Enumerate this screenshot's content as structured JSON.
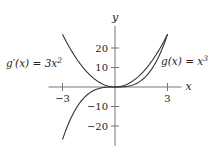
{
  "chart_data": {
    "type": "line",
    "title": "",
    "xlabel": "x",
    "ylabel": "y",
    "xlim": [
      -3.8,
      3.8
    ],
    "ylim": [
      -28,
      28
    ],
    "x_ticks": [
      {
        "value": -3,
        "label": "−3"
      },
      {
        "value": 3,
        "label": "3"
      }
    ],
    "y_ticks": [
      {
        "value": 20,
        "label": "20"
      },
      {
        "value": 10,
        "label": "10"
      },
      {
        "value": -10,
        "label": "−10"
      },
      {
        "value": -20,
        "label": "−20"
      }
    ],
    "grid": false,
    "series": [
      {
        "name": "g'(x) = 3x^2",
        "label_base": "g′(x) = 3x",
        "label_sup": "2",
        "label_position": "left",
        "function": "3*x^2",
        "domain": [
          -3,
          3
        ],
        "x": [
          -3,
          -2.5,
          -2,
          -1.5,
          -1,
          -0.5,
          0,
          0.5,
          1,
          1.5,
          2,
          2.5,
          3
        ],
        "values": [
          27,
          18.75,
          12,
          6.75,
          3,
          0.75,
          0,
          0.75,
          3,
          6.75,
          12,
          18.75,
          27
        ]
      },
      {
        "name": "g(x) = x^3",
        "label_base": "g(x) = x",
        "label_sup": "3",
        "label_position": "right",
        "function": "x^3",
        "domain": [
          -3,
          3
        ],
        "x": [
          -3,
          -2.5,
          -2,
          -1.5,
          -1,
          -0.5,
          0,
          0.5,
          1,
          1.5,
          2,
          2.5,
          3
        ],
        "values": [
          -27,
          -15.625,
          -8,
          -3.375,
          -1,
          -0.125,
          0,
          0.125,
          1,
          3.375,
          8,
          15.625,
          27
        ]
      }
    ],
    "colors": {
      "curve": "#333333",
      "axis": "#666666",
      "text": "#222222"
    }
  }
}
